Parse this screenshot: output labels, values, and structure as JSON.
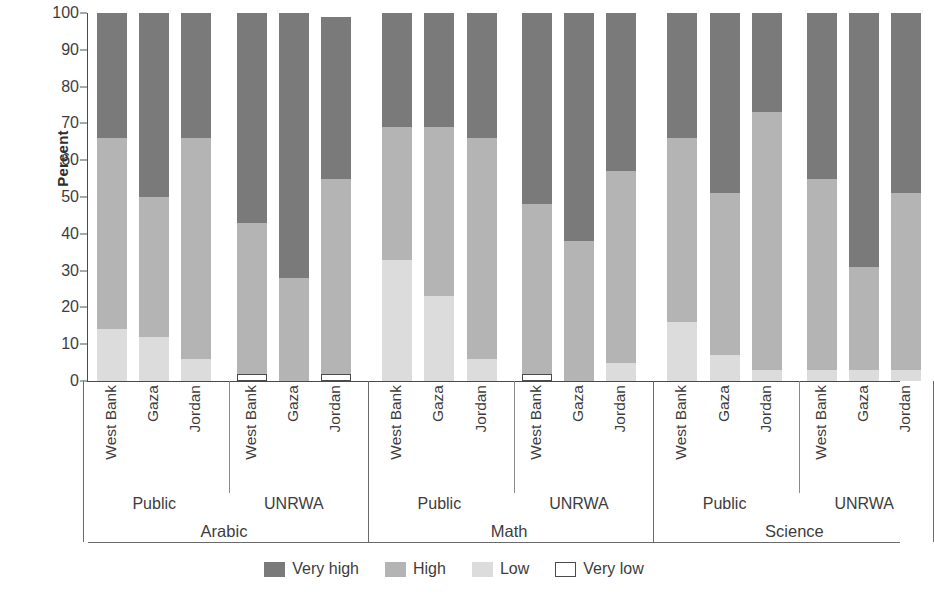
{
  "chart_data": {
    "type": "bar",
    "subtype": "stacked-bar-100",
    "title": "",
    "xlabel": "",
    "ylabel": "Percent",
    "ylim": [
      0,
      100
    ],
    "y_ticks": [
      0,
      10,
      20,
      30,
      40,
      50,
      60,
      70,
      80,
      90,
      100
    ],
    "grid": false,
    "legend_position": "bottom",
    "stack_order_bottom_to_top": [
      "Very low",
      "Low",
      "High",
      "Very high"
    ],
    "series": [
      {
        "name": "Very high",
        "color": "#7a7a7a",
        "values": [
          34,
          50,
          34,
          57,
          72,
          44,
          31,
          31,
          34,
          52,
          62,
          43,
          34,
          49,
          27,
          45,
          69,
          49
        ]
      },
      {
        "name": "High",
        "color": "#b4b4b4",
        "values": [
          52,
          38,
          60,
          41,
          28,
          53,
          36,
          46,
          60,
          46,
          38,
          52,
          50,
          44,
          70,
          52,
          28,
          48
        ]
      },
      {
        "name": "Low",
        "color": "#dcdcdc",
        "values": [
          14,
          12,
          6,
          0,
          0,
          0,
          33,
          23,
          6,
          0,
          0,
          5,
          16,
          7,
          3,
          3,
          3,
          3
        ]
      },
      {
        "name": "Very low",
        "color": "#ffffff",
        "values": [
          0,
          0,
          0,
          2,
          0,
          2,
          0,
          0,
          0,
          2,
          0,
          0,
          0,
          0,
          0,
          0,
          0,
          0
        ]
      }
    ],
    "categories": [
      {
        "country": "West Bank",
        "sector": "Public",
        "subject": "Arabic",
        "very_low": 0,
        "low": 14,
        "high": 52,
        "very_high": 34
      },
      {
        "country": "Gaza",
        "sector": "Public",
        "subject": "Arabic",
        "very_low": 0,
        "low": 12,
        "high": 38,
        "very_high": 50
      },
      {
        "country": "Jordan",
        "sector": "Public",
        "subject": "Arabic",
        "very_low": 0,
        "low": 6,
        "high": 60,
        "very_high": 34
      },
      {
        "country": "West Bank",
        "sector": "UNRWA",
        "subject": "Arabic",
        "very_low": 2,
        "low": 0,
        "high": 41,
        "very_high": 57
      },
      {
        "country": "Gaza",
        "sector": "UNRWA",
        "subject": "Arabic",
        "very_low": 0,
        "low": 0,
        "high": 28,
        "very_high": 72
      },
      {
        "country": "Jordan",
        "sector": "UNRWA",
        "subject": "Arabic",
        "very_low": 2,
        "low": 0,
        "high": 53,
        "very_high": 44
      },
      {
        "country": "West Bank",
        "sector": "Public",
        "subject": "Math",
        "very_low": 0,
        "low": 33,
        "high": 36,
        "very_high": 31
      },
      {
        "country": "Gaza",
        "sector": "Public",
        "subject": "Math",
        "very_low": 0,
        "low": 23,
        "high": 46,
        "very_high": 31
      },
      {
        "country": "Jordan",
        "sector": "Public",
        "subject": "Math",
        "very_low": 0,
        "low": 6,
        "high": 60,
        "very_high": 34
      },
      {
        "country": "West Bank",
        "sector": "UNRWA",
        "subject": "Math",
        "very_low": 2,
        "low": 0,
        "high": 46,
        "very_high": 52
      },
      {
        "country": "Gaza",
        "sector": "UNRWA",
        "subject": "Math",
        "very_low": 0,
        "low": 0,
        "high": 38,
        "very_high": 62
      },
      {
        "country": "Jordan",
        "sector": "UNRWA",
        "subject": "Math",
        "very_low": 0,
        "low": 5,
        "high": 52,
        "very_high": 43
      },
      {
        "country": "West Bank",
        "sector": "Public",
        "subject": "Science",
        "very_low": 0,
        "low": 16,
        "high": 50,
        "very_high": 34
      },
      {
        "country": "Gaza",
        "sector": "Public",
        "subject": "Science",
        "very_low": 0,
        "low": 7,
        "high": 44,
        "very_high": 49
      },
      {
        "country": "Jordan",
        "sector": "Public",
        "subject": "Science",
        "very_low": 0,
        "low": 3,
        "high": 70,
        "very_high": 27
      },
      {
        "country": "West Bank",
        "sector": "UNRWA",
        "subject": "Science",
        "very_low": 0,
        "low": 3,
        "high": 52,
        "very_high": 45
      },
      {
        "country": "Gaza",
        "sector": "UNRWA",
        "subject": "Science",
        "very_low": 0,
        "low": 3,
        "high": 28,
        "very_high": 69
      },
      {
        "country": "Jordan",
        "sector": "UNRWA",
        "subject": "Science",
        "very_low": 0,
        "low": 3,
        "high": 48,
        "very_high": 49
      }
    ],
    "sector_groups": [
      {
        "label": "Public",
        "subject": "Arabic"
      },
      {
        "label": "UNRWA",
        "subject": "Arabic"
      },
      {
        "label": "Public",
        "subject": "Math"
      },
      {
        "label": "UNRWA",
        "subject": "Math"
      },
      {
        "label": "Public",
        "subject": "Science"
      },
      {
        "label": "UNRWA",
        "subject": "Science"
      }
    ],
    "subject_groups": [
      "Arabic",
      "Math",
      "Science"
    ],
    "legend": [
      {
        "label": "Very high",
        "color": "#7a7a7a",
        "outlined": false
      },
      {
        "label": "High",
        "color": "#b4b4b4",
        "outlined": false
      },
      {
        "label": "Low",
        "color": "#dcdcdc",
        "outlined": false
      },
      {
        "label": "Very low",
        "color": "#ffffff",
        "outlined": true
      }
    ]
  },
  "axis": {
    "y_title": "Percent"
  }
}
